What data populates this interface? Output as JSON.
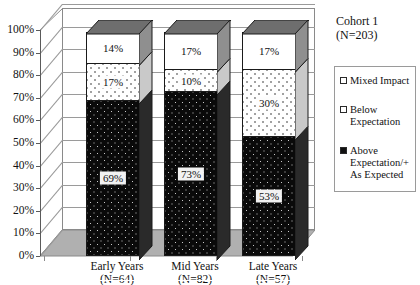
{
  "chart_data": {
    "type": "bar",
    "subtype": "stacked-column-3d",
    "title": "",
    "xlabel": "",
    "ylabel": "",
    "ylim": [
      0,
      100
    ],
    "ytick_labels": [
      "0%",
      "10%",
      "20%",
      "30%",
      "40%",
      "50%",
      "60%",
      "70%",
      "80%",
      "90%",
      "100%"
    ],
    "ytick_values": [
      0,
      10,
      20,
      30,
      40,
      50,
      60,
      70,
      80,
      90,
      100
    ],
    "grid": true,
    "legend_position": "right",
    "categories": [
      "Early Years",
      "Mid Years",
      "Late Years"
    ],
    "category_sublabels": [
      "(N=64)",
      "(N=82)",
      "(N=57)"
    ],
    "category_counts": [
      64,
      82,
      57
    ],
    "series": [
      {
        "name": "Above Expectation/+ As Expected",
        "values": [
          69,
          73,
          53
        ],
        "labels": [
          "69%",
          "73%",
          "53%"
        ],
        "color": "#0a0a0a"
      },
      {
        "name": "Below Expectation",
        "values": [
          17,
          10,
          30
        ],
        "labels": [
          "17%",
          "10%",
          "30%"
        ],
        "color": "#ffffff"
      },
      {
        "name": "Mixed Impact",
        "values": [
          14,
          17,
          17
        ],
        "labels": [
          "14%",
          "17%",
          "17%"
        ],
        "color": "#ffffff"
      }
    ]
  },
  "panel": {
    "cohort_title": "Cohort 1\n(N=203)"
  },
  "legend": {
    "items": [
      {
        "label": "Mixed Impact",
        "swatch": "mixed"
      },
      {
        "label": "Below\nExpectation",
        "swatch": "below"
      },
      {
        "label": "Above\nExpectation/+\nAs Expected",
        "swatch": "above"
      }
    ]
  }
}
